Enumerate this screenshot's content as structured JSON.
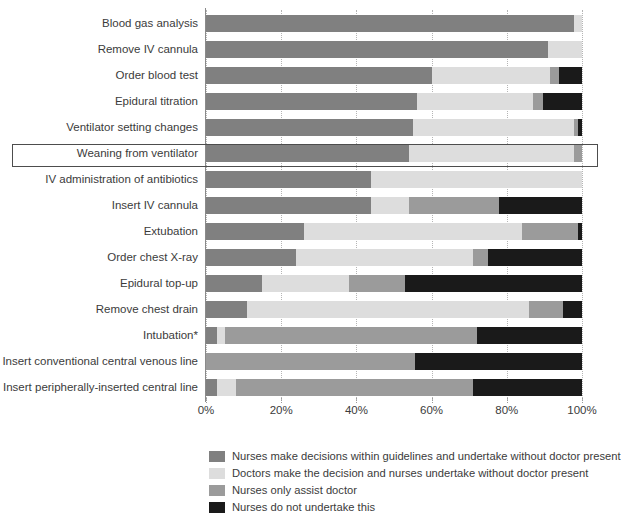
{
  "chart_data": {
    "type": "bar",
    "orientation": "horizontal",
    "stacked": true,
    "normalized_percent": true,
    "title": "",
    "subtitle": "",
    "xlabel": "",
    "ylabel": "",
    "xlim": [
      0,
      100
    ],
    "xticks": [
      "0%",
      "20%",
      "40%",
      "60%",
      "80%",
      "100%"
    ],
    "xtick_values": [
      0,
      20,
      40,
      60,
      80,
      100
    ],
    "grid": "vertical-dotted",
    "legend_position": "bottom",
    "categories": [
      "Blood gas analysis",
      "Remove IV cannula",
      "Order blood test",
      "Epidural titration",
      "Ventilator setting changes",
      "Weaning from ventilator",
      "IV administration of antibiotics",
      "Insert IV cannula",
      "Extubation",
      "Order chest X-ray",
      "Epidural top-up",
      "Remove chest drain",
      "Intubation*",
      "Insert conventional central venous line",
      "Insert peripherally-inserted central line"
    ],
    "series": [
      {
        "name": "Nurses make decisions within guidelines and undertake without doctor present",
        "color": "#808080",
        "values": [
          98,
          91,
          60,
          56,
          55,
          54,
          44,
          44,
          26,
          24,
          15,
          11,
          3,
          0,
          3
        ]
      },
      {
        "name": "Doctors make the decision and nurses undertake without doctor present",
        "color": "#dddddd",
        "values": [
          2,
          9,
          31.5,
          31,
          43,
          44,
          56,
          10,
          58,
          47,
          23,
          75,
          2,
          0,
          5
        ]
      },
      {
        "name": "Nurses only assist doctor",
        "color": "#9b9b9b",
        "values": [
          0,
          0,
          2.5,
          2.5,
          1,
          2,
          0,
          24,
          15,
          4,
          15,
          9,
          67,
          55.5,
          63
        ]
      },
      {
        "name": "Nurses do not undertake this",
        "color": "#1a1a1a",
        "values": [
          0,
          0,
          6,
          10.5,
          1,
          0,
          0,
          22,
          1,
          25,
          47,
          5,
          28,
          44.5,
          29
        ]
      }
    ],
    "annotations": {
      "highlighted_category": "Weaning from ventilator",
      "footnote_marker": "*"
    }
  },
  "legend": {
    "items": [
      {
        "label": "Nurses make decisions within guidelines and undertake without doctor present",
        "color": "#808080"
      },
      {
        "label": "Doctors make the decision and nurses undertake without doctor present",
        "color": "#dddddd"
      },
      {
        "label": "Nurses only assist doctor",
        "color": "#9b9b9b"
      },
      {
        "label": "Nurses do not undertake this",
        "color": "#1a1a1a"
      }
    ]
  }
}
